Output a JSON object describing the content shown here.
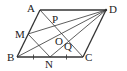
{
  "diagram": {
    "type": "geometry",
    "shape": "parallelogram",
    "colors": {
      "line": "#333333",
      "label": "#222222",
      "background": "#ffffff"
    },
    "points": {
      "A": {
        "label": "A",
        "x": 40,
        "y": 10
      },
      "B": {
        "label": "B",
        "x": 17,
        "y": 57
      },
      "C": {
        "label": "C",
        "x": 83,
        "y": 57
      },
      "D": {
        "label": "D",
        "x": 106,
        "y": 10
      },
      "M": {
        "label": "M",
        "x": 28,
        "y": 34
      },
      "N": {
        "label": "N",
        "x": 50,
        "y": 57
      },
      "O": {
        "label": "O",
        "x": 61,
        "y": 33
      },
      "P": {
        "label": "P",
        "x": 52,
        "y": 22
      },
      "Q": {
        "label": "Q",
        "x": 68,
        "y": 42
      }
    },
    "segments": [
      [
        "A",
        "B"
      ],
      [
        "B",
        "C"
      ],
      [
        "C",
        "D"
      ],
      [
        "D",
        "A"
      ],
      [
        "A",
        "C"
      ],
      [
        "B",
        "D"
      ],
      [
        "M",
        "D"
      ],
      [
        "N",
        "D"
      ],
      [
        "M",
        "N"
      ]
    ],
    "tick_marks": [
      "BN",
      "NC"
    ]
  }
}
